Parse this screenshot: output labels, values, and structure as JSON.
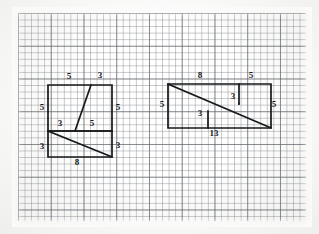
{
  "image": {
    "kind": "hand-drawn-geometry-on-graph-paper",
    "title": "Missing square dissection puzzle",
    "background_color": "#fbfbfa",
    "grid_line_color": "#787c82",
    "figure_line_color": "#17181a"
  },
  "grid": {
    "minor_spacing_px": 6.55,
    "major_every": 5,
    "origin_x_px": 18,
    "origin_y_px": 13,
    "width_px": 288,
    "height_px": 208
  },
  "figures": [
    {
      "id": "left-figure",
      "name": "staircase-triangle-arrangement",
      "outline_label": "left assembled shape",
      "labels": [
        {
          "id": "L-top-5",
          "text": "5",
          "x": 69,
          "y": 76,
          "edge": "top-left-segment"
        },
        {
          "id": "L-top-3",
          "text": "3",
          "x": 100,
          "y": 75,
          "edge": "top-right-segment"
        },
        {
          "id": "L-left-5",
          "text": "5",
          "x": 42,
          "y": 107,
          "edge": "upper-left-side"
        },
        {
          "id": "L-right-5",
          "text": "5",
          "x": 118,
          "y": 107,
          "edge": "upper-right-side"
        },
        {
          "id": "L-mid-3",
          "text": "3",
          "x": 60,
          "y": 123,
          "edge": "middle-left-segment"
        },
        {
          "id": "L-mid-5",
          "text": "5",
          "x": 92,
          "y": 123,
          "edge": "middle-right-segment"
        },
        {
          "id": "L-left-3",
          "text": "3",
          "x": 42,
          "y": 146,
          "edge": "lower-left-side"
        },
        {
          "id": "L-right-3",
          "text": "3",
          "x": 118,
          "y": 145,
          "edge": "lower-right-side"
        },
        {
          "id": "L-bottom-8",
          "text": "8",
          "x": 77,
          "y": 162,
          "edge": "bottom-side"
        }
      ]
    },
    {
      "id": "right-figure",
      "name": "rectangle-with-diagonal-dissection",
      "outline_label": "right assembled shape",
      "labels": [
        {
          "id": "R-top-8",
          "text": "8",
          "x": 200,
          "y": 75,
          "edge": "top-left-segment"
        },
        {
          "id": "R-top-5",
          "text": "5",
          "x": 251,
          "y": 75,
          "edge": "top-right-segment"
        },
        {
          "id": "R-left-5",
          "text": "5",
          "x": 162,
          "y": 104,
          "edge": "left-side"
        },
        {
          "id": "R-right-5",
          "text": "5",
          "x": 274,
          "y": 104,
          "edge": "right-side"
        },
        {
          "id": "R-inner-3-hi",
          "text": "3",
          "x": 233,
          "y": 96,
          "edge": "upper-inner-vertical"
        },
        {
          "id": "R-inner-3-lo",
          "text": "3",
          "x": 200,
          "y": 113,
          "edge": "lower-inner-vertical"
        },
        {
          "id": "R-bottom-13",
          "text": "13",
          "x": 214,
          "y": 133,
          "edge": "bottom-side"
        }
      ]
    }
  ],
  "measurements": {
    "left_shape_values": [
      "5",
      "3",
      "5",
      "5",
      "3",
      "5",
      "3",
      "3",
      "8"
    ],
    "right_shape_values": [
      "8",
      "5",
      "5",
      "5",
      "3",
      "3",
      "13"
    ],
    "unique_numbers": [
      "3",
      "5",
      "8",
      "13"
    ]
  }
}
